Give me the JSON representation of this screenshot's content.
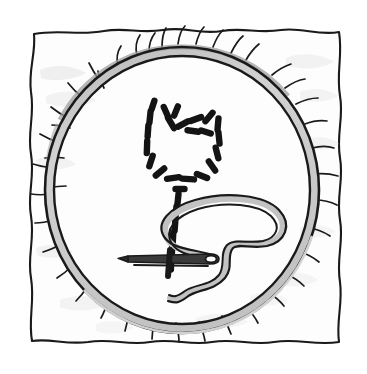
{
  "illustration": {
    "title": "Embroidery hoop with partially stitched tulip",
    "subject": "embroidery-hoop",
    "style": "black-and-white pen line drawing with grey wash",
    "caption": "",
    "canvas": {
      "width": 367,
      "height": 374,
      "background": "#ffffff"
    }
  },
  "palette": {
    "ink": "#1a1a1a",
    "paper": "#ffffff",
    "fabric_fill": "#fdfdfd",
    "fabric_shadow": "#e9e9e9",
    "fabric_shadow_soft": "#f2f2f2",
    "hoop_band": "#c9c9c9",
    "hoop_band_light": "#dddddd",
    "hoop_band_dark": "#a8a8a8",
    "thread_fill": "#c4c4c4",
    "stitch": "#141414"
  },
  "objects": {
    "fabric": {
      "name": "square cloth",
      "edge": "wavy hand-drawn square",
      "fray_count": 38
    },
    "hoop": {
      "name": "embroidery hoop",
      "shape": "ellipse",
      "center": {
        "x": 182,
        "y": 190
      },
      "radius_x": 137,
      "radius_y": 143,
      "band_width": 9
    },
    "pattern": {
      "name": "tulip running-stitch outline",
      "stitch_count": 33,
      "bloom_stitches": 22,
      "stem_stitches": 11
    },
    "needle": {
      "name": "sewing needle",
      "orientation": "horizontal",
      "tip": {
        "x": 128,
        "y": 259
      },
      "eye": {
        "x": 216,
        "y": 259
      },
      "length": 88
    },
    "thread": {
      "name": "thread loop",
      "shape": "s-curve loop",
      "anchor": {
        "x": 216,
        "y": 259
      }
    }
  },
  "stitches": {
    "bloom": [
      {
        "x": 153,
        "y": 105,
        "a": -72,
        "l": 9
      },
      {
        "x": 150,
        "y": 117,
        "a": -84,
        "l": 11
      },
      {
        "x": 148,
        "y": 131,
        "a": -86,
        "l": 11
      },
      {
        "x": 147,
        "y": 147,
        "a": -88,
        "l": 12
      },
      {
        "x": 151,
        "y": 161,
        "a": -72,
        "l": 11
      },
      {
        "x": 160,
        "y": 172,
        "a": -40,
        "l": 11
      },
      {
        "x": 173,
        "y": 178,
        "a": -8,
        "l": 12
      },
      {
        "x": 188,
        "y": 179,
        "a": 4,
        "l": 12
      },
      {
        "x": 202,
        "y": 176,
        "a": 22,
        "l": 11
      },
      {
        "x": 212,
        "y": 166,
        "a": 55,
        "l": 11
      },
      {
        "x": 217,
        "y": 153,
        "a": 76,
        "l": 11
      },
      {
        "x": 219,
        "y": 138,
        "a": 84,
        "l": 11
      },
      {
        "x": 218,
        "y": 124,
        "a": 95,
        "l": 11
      },
      {
        "x": 209,
        "y": 117,
        "a": 130,
        "l": 11
      },
      {
        "x": 196,
        "y": 119,
        "a": 160,
        "l": 11
      },
      {
        "x": 183,
        "y": 124,
        "a": 152,
        "l": 11
      },
      {
        "x": 171,
        "y": 123,
        "a": 60,
        "l": 12
      },
      {
        "x": 166,
        "y": 112,
        "a": 66,
        "l": 11
      },
      {
        "x": 176,
        "y": 111,
        "a": 112,
        "l": 10
      },
      {
        "x": 193,
        "y": 131,
        "a": 8,
        "l": 11
      },
      {
        "x": 206,
        "y": 132,
        "a": 18,
        "l": 10
      },
      {
        "x": 180,
        "y": 189,
        "a": 0,
        "l": 9
      }
    ],
    "stem": [
      {
        "x": 178,
        "y": 199,
        "a": -84,
        "l": 10
      },
      {
        "x": 176,
        "y": 212,
        "a": -85,
        "l": 11
      },
      {
        "x": 175,
        "y": 225,
        "a": -86,
        "l": 11
      },
      {
        "x": 173,
        "y": 238,
        "a": -87,
        "l": 11
      },
      {
        "x": 172,
        "y": 251,
        "a": -88,
        "l": 11
      },
      {
        "x": 171,
        "y": 264,
        "a": -89,
        "l": 11
      }
    ]
  }
}
